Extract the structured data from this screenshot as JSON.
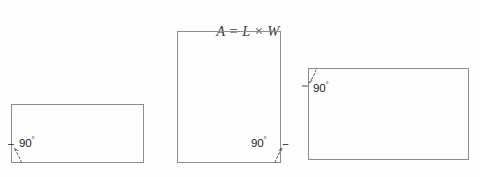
{
  "canvas": {
    "width": 480,
    "height": 177,
    "background_color": "#fefefe",
    "stroke_color": "#8c8c8c",
    "text_color": "#1d1d1d"
  },
  "formula": {
    "full_text": "A = L × W",
    "area_symbol": "A",
    "equals": "=",
    "length_symbol": "L",
    "times": "×",
    "width_symbol": "W"
  },
  "shapes": [
    {
      "name": "left-rectangle",
      "x": 11,
      "y": 104,
      "width": 133,
      "height": 59,
      "angle_label": "90",
      "angle_degree_symbol": "°",
      "angle_corner": "bottom-left"
    },
    {
      "name": "middle-rectangle",
      "x": 177,
      "y": 31,
      "width": 104,
      "height": 132,
      "angle_label": "90",
      "angle_degree_symbol": "°",
      "angle_corner": "bottom-right"
    },
    {
      "name": "right-rectangle",
      "x": 308,
      "y": 68,
      "width": 161,
      "height": 92,
      "angle_label": "90",
      "angle_degree_symbol": "°",
      "angle_corner": "top-left"
    }
  ]
}
